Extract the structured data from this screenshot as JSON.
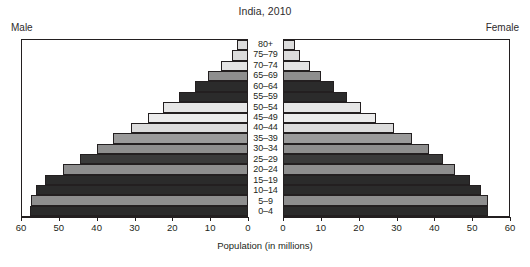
{
  "chart_data": {
    "type": "bar",
    "subtype": "population-pyramid",
    "title": "India, 2010",
    "xlabel": "Population (in millions)",
    "ylabel": "",
    "left_panel_label": "Male",
    "right_panel_label": "Female",
    "categories": [
      "0-4",
      "5-9",
      "10-14",
      "15-19",
      "20-24",
      "25-29",
      "30-34",
      "35-39",
      "40-44",
      "45-49",
      "50-54",
      "55-59",
      "60-64",
      "65-69",
      "70-74",
      "75-79",
      "80+"
    ],
    "tick_labels_left": [
      "60",
      "50",
      "40",
      "30",
      "20",
      "10",
      "0"
    ],
    "tick_labels_right": [
      "0",
      "10",
      "20",
      "30",
      "40",
      "50",
      "60"
    ],
    "xlim": [
      0,
      60
    ],
    "xticks": [
      0,
      10,
      20,
      30,
      40,
      50,
      60
    ],
    "grid": false,
    "legend": false,
    "series": [
      {
        "name": "Male",
        "values": [
          57.8,
          57.5,
          56.4,
          53.8,
          49.2,
          44.6,
          40.0,
          35.8,
          31.0,
          26.5,
          22.3,
          18.1,
          13.8,
          10.3,
          7.0,
          4.1,
          2.7
        ]
      },
      {
        "name": "Female",
        "values": [
          54.4,
          54.3,
          52.4,
          49.7,
          45.7,
          42.4,
          38.6,
          34.2,
          29.4,
          24.5,
          20.5,
          16.8,
          13.2,
          10.0,
          7.0,
          4.3,
          3.0
        ]
      }
    ],
    "bar_fills": [
      "#2b2b2b",
      "#8e8e8e",
      "#2b2b2b",
      "#2b2b2b",
      "#8e8e8e",
      "#3a3a3a",
      "#8e8e8e",
      "#9a9a9a",
      "#dcdcdc",
      "#ececec",
      "#e6e6e6",
      "#2b2b2b",
      "#2b2b2b",
      "#8e8e8e",
      "#e4e4e4",
      "#dcdcdc",
      "#dcdcdc"
    ],
    "outline_color": "#231f20"
  },
  "axis": {
    "tick_positions_pct": [
      0,
      16.666,
      33.333,
      50,
      66.666,
      83.333,
      100
    ]
  }
}
